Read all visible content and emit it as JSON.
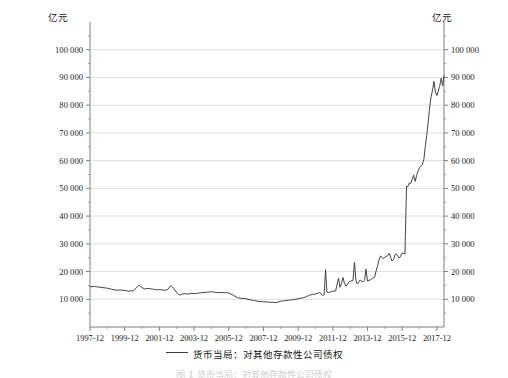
{
  "axes": {
    "unit_left": "亿元",
    "unit_right": "亿元"
  },
  "legend": {
    "series_label": "货币当局：对其他存款性公司债权",
    "line_color": "#3b3b3b"
  },
  "caption": "图 1 货币当局：对其他存款性公司债权",
  "chart_data": {
    "type": "line",
    "title": "",
    "xlabel": "",
    "ylabel": "亿元",
    "grid": true,
    "legend_position": "bottom",
    "ylim": [
      0,
      110000
    ],
    "ytick_labels": [
      "10 000",
      "20 000",
      "30 000",
      "40 000",
      "50 000",
      "60 000",
      "70 000",
      "80 000",
      "90 000",
      "100 000"
    ],
    "ytick_values": [
      10000,
      20000,
      30000,
      40000,
      50000,
      60000,
      70000,
      80000,
      90000,
      100000
    ],
    "xtick_labels": [
      "1997-12",
      "1999-12",
      "2001-12",
      "2003-12",
      "2005-12",
      "2007-12",
      "2009-12",
      "2011-12",
      "2013-12",
      "2015-12",
      "2017-12"
    ],
    "xtick_values": [
      1997.92,
      1999.92,
      2001.92,
      2003.92,
      2005.92,
      2007.92,
      2009.92,
      2011.92,
      2013.92,
      2015.92,
      2017.92
    ],
    "xlim": [
      1997.92,
      2018.33
    ],
    "series": [
      {
        "name": "货币当局：对其他存款性公司债权",
        "color": "#3b3b3b",
        "x": [
          1997.92,
          1998.17,
          1998.42,
          1998.67,
          1998.92,
          1999.17,
          1999.42,
          1999.67,
          1999.92,
          2000.17,
          2000.42,
          2000.58,
          2000.75,
          2000.92,
          2001.08,
          2001.25,
          2001.42,
          2001.58,
          2001.75,
          2001.92,
          2002.08,
          2002.25,
          2002.42,
          2002.58,
          2002.75,
          2002.92,
          2003.08,
          2003.25,
          2003.42,
          2003.58,
          2003.75,
          2003.92,
          2004.08,
          2004.25,
          2004.42,
          2004.58,
          2004.75,
          2004.92,
          2005.17,
          2005.42,
          2005.67,
          2005.92,
          2006.17,
          2006.42,
          2006.67,
          2006.92,
          2007.17,
          2007.42,
          2007.67,
          2007.92,
          2008.17,
          2008.42,
          2008.67,
          2008.92,
          2009.17,
          2009.42,
          2009.67,
          2009.92,
          2010.08,
          2010.25,
          2010.42,
          2010.58,
          2010.75,
          2010.92,
          2011.08,
          2011.17,
          2011.25,
          2011.33,
          2011.42,
          2011.5,
          2011.58,
          2011.67,
          2011.75,
          2011.83,
          2011.92,
          2012.08,
          2012.17,
          2012.25,
          2012.33,
          2012.42,
          2012.5,
          2012.58,
          2012.67,
          2012.75,
          2012.83,
          2012.92,
          2013.08,
          2013.17,
          2013.25,
          2013.33,
          2013.42,
          2013.5,
          2013.58,
          2013.67,
          2013.75,
          2013.83,
          2013.92,
          2014.08,
          2014.17,
          2014.25,
          2014.33,
          2014.42,
          2014.5,
          2014.58,
          2014.67,
          2014.75,
          2014.83,
          2014.92,
          2015.08,
          2015.17,
          2015.25,
          2015.33,
          2015.42,
          2015.5,
          2015.58,
          2015.67,
          2015.75,
          2015.83,
          2015.92,
          2016.08,
          2016.17,
          2016.25,
          2016.33,
          2016.42,
          2016.5,
          2016.58,
          2016.67,
          2016.75,
          2016.83,
          2016.92,
          2017.08,
          2017.17,
          2017.25,
          2017.33,
          2017.42,
          2017.5,
          2017.58,
          2017.67,
          2017.75,
          2017.83,
          2017.92,
          2018.08,
          2018.17,
          2018.25,
          2018.33
        ],
        "values": [
          14500,
          14600,
          14400,
          14200,
          14000,
          13600,
          13300,
          13300,
          13200,
          12900,
          13100,
          14000,
          15100,
          14200,
          13700,
          13900,
          13800,
          13600,
          13400,
          13500,
          13400,
          13200,
          13600,
          15000,
          13900,
          12400,
          11500,
          11900,
          12000,
          11900,
          12100,
          12000,
          12100,
          12300,
          12400,
          12500,
          12600,
          12700,
          12500,
          12400,
          12400,
          12300,
          11500,
          10600,
          10300,
          10200,
          9800,
          9500,
          9200,
          9100,
          9000,
          8900,
          8800,
          9300,
          9500,
          9700,
          9900,
          10200,
          10400,
          10600,
          11000,
          11500,
          11700,
          11900,
          12200,
          12500,
          11800,
          11400,
          11600,
          20700,
          12600,
          12400,
          12600,
          12700,
          12900,
          13000,
          15500,
          17600,
          14300,
          15600,
          17900,
          16000,
          14700,
          15200,
          16100,
          16500,
          16800,
          23400,
          16900,
          15500,
          16200,
          17000,
          16500,
          16300,
          16900,
          20900,
          16600,
          17000,
          17400,
          17700,
          17900,
          20300,
          22100,
          24100,
          25600,
          25200,
          24600,
          25200,
          25700,
          26600,
          25100,
          23800,
          24400,
          25900,
          26400,
          25500,
          24800,
          25600,
          26700,
          26400,
          50800,
          50600,
          52000,
          51800,
          53300,
          54800,
          52500,
          54600,
          56200,
          57500,
          58600,
          60500,
          65000,
          69000,
          74000,
          79000,
          82800,
          85500,
          88600,
          84800,
          83500,
          86800,
          89800,
          87000,
          90500
        ],
        "peak_value": 103000,
        "start_value": 14500,
        "end_value": 103000,
        "min_value": 8800
      }
    ]
  }
}
